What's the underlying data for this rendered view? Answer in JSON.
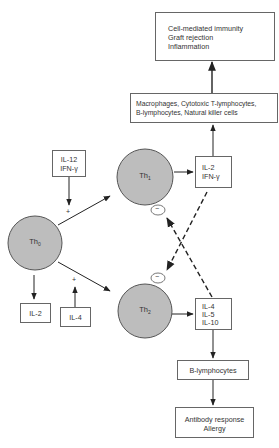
{
  "diagram": {
    "colors": {
      "cell_fill": "#bdbdbd",
      "stroke": "#555555",
      "line": "#222222",
      "background": "#ffffff"
    },
    "boxes": {
      "outcome_th1": {
        "lines": [
          "Cell-mediated immunity",
          "Graft rejection",
          "Inflammation"
        ]
      },
      "effector_cells": {
        "lines": [
          "Macrophages,  Cytotoxic T-lymphocytes,",
          "B-lymphocytes, Natural killer cells"
        ]
      },
      "th1_cytokines": {
        "lines": [
          "IL-2",
          "IFN-γ"
        ]
      },
      "th1_inducers": {
        "lines": [
          "IL-12",
          "IFN-γ"
        ]
      },
      "th0_product": {
        "lines": [
          "IL-2"
        ]
      },
      "th2_inducer": {
        "lines": [
          "IL-4"
        ]
      },
      "th2_cytokines": {
        "lines": [
          "IL-4",
          "IL-5",
          "IL-10"
        ]
      },
      "b_cells": {
        "lines": [
          "B-lymphocytes"
        ]
      },
      "outcome_th2": {
        "lines": [
          "Antibody response",
          "Allergy"
        ]
      }
    },
    "cells": {
      "th0": {
        "base": "Th",
        "sub": "0"
      },
      "th1": {
        "base": "Th",
        "sub": "1"
      },
      "th2": {
        "base": "Th",
        "sub": "2"
      }
    },
    "signs": {
      "plus_th1": "+",
      "plus_th2": "+",
      "minus_th1": "−",
      "minus_th2": "−"
    }
  }
}
